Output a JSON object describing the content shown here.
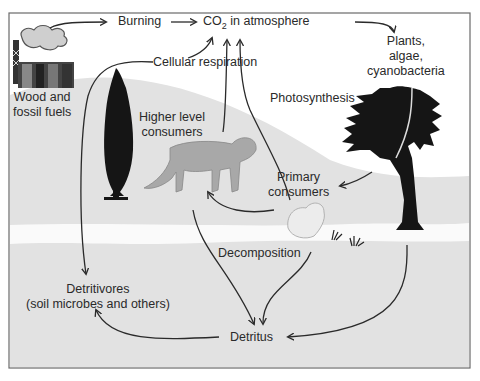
{
  "diagram": {
    "labels": {
      "burning": "Burning",
      "co2_prefix": "CO",
      "co2_sub": "2",
      "co2_suffix": " in atmosphere",
      "plants_line1": "Plants,",
      "plants_line2": "algae,",
      "plants_line3": "cyanobacteria",
      "wood_line1": "Wood and",
      "wood_line2": "fossil fuels",
      "cellular_respiration": "Cellular respiration",
      "photosynthesis": "Photosynthesis",
      "higher_line1": "Higher level",
      "higher_line2": "consumers",
      "primary_line1": "Primary",
      "primary_line2": "consumers",
      "decomposition": "Decomposition",
      "detritivores_line1": "Detritivores",
      "detritivores_line2": "(soil microbes and others)",
      "detritus": "Detritus"
    },
    "nodes": [
      "Wood and fossil fuels",
      "Burning",
      "CO2 in atmosphere",
      "Plants, algae, cyanobacteria",
      "Higher level consumers",
      "Primary consumers",
      "Detritus",
      "Detritivores (soil microbes and others)"
    ],
    "edges": [
      {
        "from": "Wood and fossil fuels",
        "to": "Burning"
      },
      {
        "from": "Burning",
        "to": "CO2 in atmosphere"
      },
      {
        "from": "CO2 in atmosphere",
        "to": "Plants, algae, cyanobacteria",
        "label": "Photosynthesis"
      },
      {
        "from": "Plants, algae, cyanobacteria",
        "to": "CO2 in atmosphere",
        "label": "Cellular respiration"
      },
      {
        "from": "Higher level consumers",
        "to": "CO2 in atmosphere",
        "label": "Cellular respiration"
      },
      {
        "from": "Detritivores (soil microbes and others)",
        "to": "CO2 in atmosphere",
        "label": "Cellular respiration"
      },
      {
        "from": "Plants, algae, cyanobacteria",
        "to": "Primary consumers"
      },
      {
        "from": "Primary consumers",
        "to": "Higher level consumers"
      },
      {
        "from": "Higher level consumers",
        "to": "Detritus",
        "label": "Decomposition"
      },
      {
        "from": "Primary consumers",
        "to": "Detritus",
        "label": "Decomposition"
      },
      {
        "from": "Plants, algae, cyanobacteria",
        "to": "Detritus"
      },
      {
        "from": "Detritus",
        "to": "Detritivores (soil microbes and others)"
      }
    ],
    "icons": [
      "factory-icon",
      "cypress-tree-icon",
      "mountain-lion-icon",
      "rabbit-icon",
      "acacia-tree-icon",
      "grass-icon"
    ],
    "colors": {
      "frame": "#6a6a6a",
      "sky": "#ffffff",
      "hill": "#e2e2e2",
      "ground": "#e6e6e6",
      "river": "#fafafa",
      "ink": "#2a2a2a",
      "silhouette": "#151515"
    }
  }
}
